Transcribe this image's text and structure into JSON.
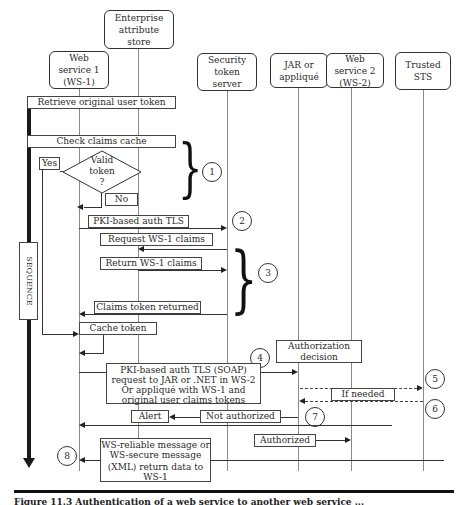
{
  "actors": [
    {
      "id": "ws1",
      "label": "Web service 1 (WS-1)",
      "lines": [
        "Web",
        "service 1",
        "(WS-1)"
      ]
    },
    {
      "id": "eas",
      "label": "Enterprise attribute store",
      "lines": [
        "Enterprise",
        "attribute",
        "store"
      ]
    },
    {
      "id": "sts",
      "label": "Security token server",
      "lines": [
        "Security",
        "token",
        "server"
      ]
    },
    {
      "id": "jar",
      "label": "JAR or appliqué",
      "lines": [
        "JAR or",
        "appliqué"
      ]
    },
    {
      "id": "ws2",
      "label": "Web service 2 (WS-2)",
      "lines": [
        "Web",
        "service 2",
        "(WS-2)"
      ]
    },
    {
      "id": "tsts",
      "label": "Trusted STS",
      "lines": [
        "Trusted",
        "STS"
      ]
    }
  ],
  "sequence_label": "SEQUENCE",
  "steps": {
    "retrieve": "Retrieve original user token",
    "check_cache": "Check claims cache",
    "yes": "Yes",
    "no": "No",
    "valid_token": [
      "Valid",
      "token",
      "?"
    ],
    "pki_tls": "PKI-based    auth TLS",
    "request_claims": "Request WS-1 claims",
    "return_claims": "Return WS-1 claims",
    "claims_returned": "Claims token returned",
    "cache_token": "Cache token",
    "auth_decision": [
      "Authorization",
      "decision"
    ],
    "soap_request": [
      "PKI-based auth  TLS (SOAP)",
      "request to JAR or .NET in WS-2",
      "Or appliqué with WS-1 and",
      "original user claims tokens"
    ],
    "if_needed": "If needed",
    "alert": "Alert",
    "not_authorized": "Not authorized",
    "authorized": "Authorized",
    "reliable_message": [
      "WS-reliable message or",
      "WS-secure message",
      "(XML) return data to",
      "WS-1"
    ]
  },
  "markers": [
    "1",
    "2",
    "3",
    "4",
    "5",
    "6",
    "7",
    "8"
  ],
  "caption": "Figure 11.3   Authentication of a web service to another web service ..."
}
